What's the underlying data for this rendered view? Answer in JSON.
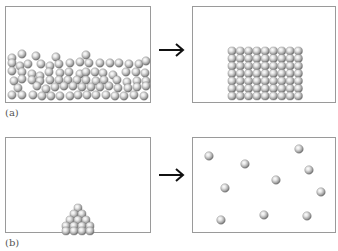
{
  "figure": {
    "panels": [
      {
        "id": "a",
        "label": "(a)",
        "left_state": "liquid (disordered particles filling bottom of container)",
        "right_state": "solid (ordered crystalline lattice block)"
      },
      {
        "id": "b",
        "label": "(b)",
        "left_state": "solid (small pyramid of particles)",
        "right_state": "gas (10 widely scattered particles)"
      }
    ],
    "arrow_symbol": "→",
    "colors": {
      "particle_light": "#f4f4f4",
      "particle_mid": "#b9b9b9",
      "particle_dark": "#6f6f6f",
      "box_border": "#9a9a9a",
      "arrow": "#111111"
    }
  }
}
